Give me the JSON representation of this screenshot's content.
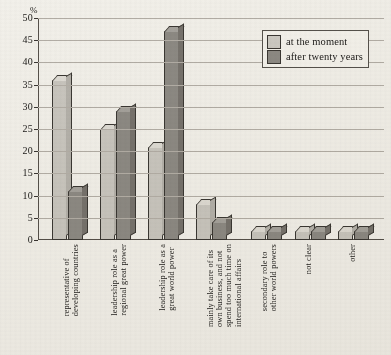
{
  "chart_data": {
    "type": "bar",
    "title": "",
    "xlabel": "",
    "ylabel": "%",
    "ylim": [
      0,
      50
    ],
    "ytick_step": 5,
    "yticks": [
      50,
      45,
      40,
      35,
      30,
      25,
      20,
      15,
      10,
      5,
      0
    ],
    "grid": true,
    "legend_position": "top-right",
    "categories": [
      "representative of developing countries",
      "leadership role as a regional great power",
      "leadership role as a great world power",
      "mainly take care of its own business, and not spend too much time on international affairs",
      "secondary role to other world powers",
      "not clear",
      "other"
    ],
    "category_lines": [
      [
        "representative of",
        "developing countries"
      ],
      [
        "leadership role as a",
        "regional great power"
      ],
      [
        "leadership role as a",
        "great world power"
      ],
      [
        "mainly take care of its",
        "own business, and not",
        "spend too much time on",
        "international affairs"
      ],
      [
        "secondary role to",
        "other world powers"
      ],
      [
        "not clear"
      ],
      [
        "other"
      ]
    ],
    "series": [
      {
        "name": "at the moment",
        "color": "#c9c6bf",
        "values": [
          36,
          25,
          21,
          8,
          2,
          2,
          2
        ]
      },
      {
        "name": "after twenty years",
        "color": "#8d8a84",
        "values": [
          11,
          29,
          47,
          4,
          2,
          2,
          2
        ]
      }
    ]
  },
  "axis": {
    "unit_label": "%"
  },
  "legend": {
    "entries": [
      {
        "label": "at the moment",
        "swatch": "light"
      },
      {
        "label": "after twenty years",
        "swatch": "dark"
      }
    ]
  }
}
